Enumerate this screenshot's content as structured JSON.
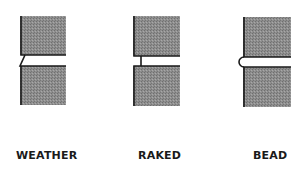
{
  "diagram": {
    "title": "",
    "joints": [
      {
        "id": "weather",
        "label": "WEATHER",
        "profile": "sloped"
      },
      {
        "id": "raked",
        "label": "RAKED",
        "profile": "recessed-square"
      },
      {
        "id": "bead",
        "label": "BEAD",
        "profile": "convex-bead"
      }
    ],
    "colors": {
      "brick_fill": "#8e8e8e",
      "outline": "#1a1a1a",
      "mortar": "#f2f2f2"
    }
  }
}
